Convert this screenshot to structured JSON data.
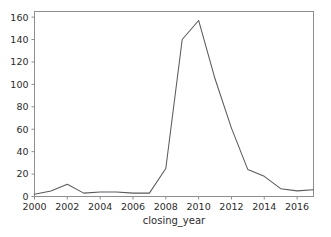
{
  "chart_data": {
    "type": "line",
    "title": "",
    "xlabel": "closing_year",
    "ylabel": "",
    "x": [
      2000,
      2001,
      2002,
      2003,
      2004,
      2005,
      2006,
      2007,
      2008,
      2009,
      2010,
      2011,
      2012,
      2013,
      2014,
      2015,
      2016,
      2017
    ],
    "values": [
      2,
      5,
      11,
      3,
      4,
      4,
      3,
      3,
      25,
      140,
      157,
      105,
      61,
      24,
      18,
      7,
      5,
      6
    ],
    "series": [
      {
        "name": "count",
        "values": [
          2,
          5,
          11,
          3,
          4,
          4,
          3,
          3,
          25,
          140,
          157,
          105,
          61,
          24,
          18,
          7,
          5,
          6
        ]
      }
    ],
    "xlim": [
      2000,
      2017
    ],
    "ylim": [
      0,
      165
    ],
    "xticks": [
      2000,
      2002,
      2004,
      2006,
      2008,
      2010,
      2012,
      2014,
      2016
    ],
    "xtick_labels": [
      "2000",
      "2002",
      "2004",
      "2006",
      "2008",
      "2010",
      "2012",
      "2014",
      "2016"
    ],
    "yticks": [
      0,
      20,
      40,
      60,
      80,
      100,
      120,
      140,
      160
    ],
    "ytick_labels": [
      "0",
      "20",
      "40",
      "60",
      "80",
      "100",
      "120",
      "140",
      "160"
    ],
    "grid": false,
    "legend": false,
    "legend_position": "none",
    "line_color": "#5a5a5a",
    "background_color": "#ffffff",
    "axis_color": "#8e8e8e"
  }
}
